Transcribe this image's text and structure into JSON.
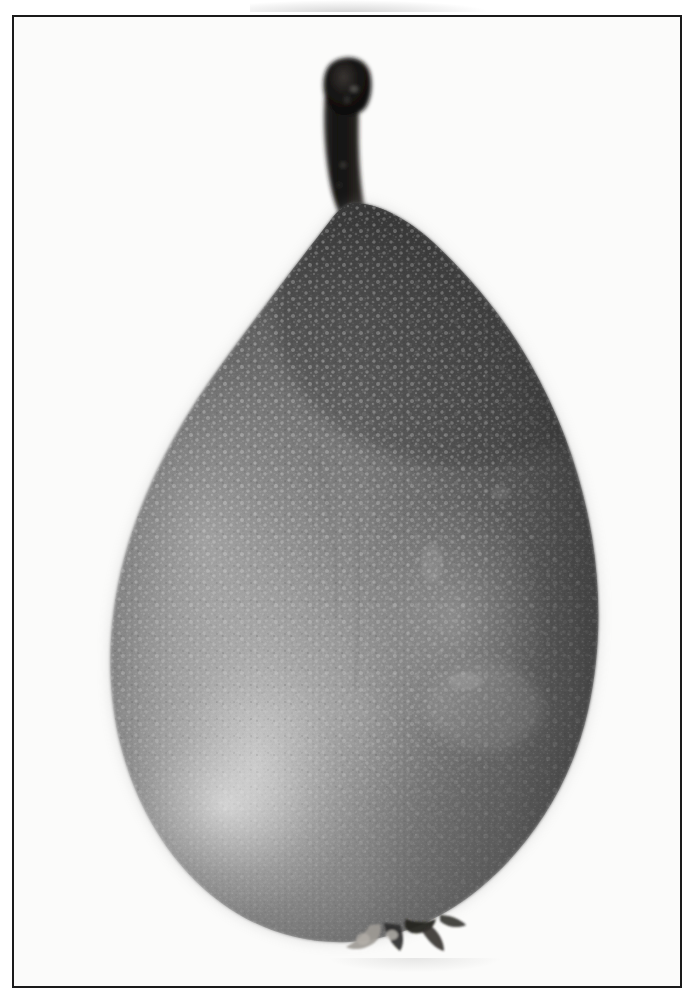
{
  "image": {
    "kind": "photographic-plate",
    "subject": "pear",
    "medium": "black-and-white photograph",
    "alt_text": "Black and white photograph of a single pear with a long dark stem, shown against a plain white background inside a thin black rectangular border.",
    "caption": "",
    "background_color": "#fbfbfa",
    "frame": {
      "color": "#1a1a1a",
      "thickness_px": 2,
      "left": 12,
      "top": 15,
      "width": 670,
      "height": 973
    }
  },
  "subject": {
    "name": "pear",
    "orientation": "upright, stem at top",
    "body": {
      "label": "pear-body",
      "left_px": 113,
      "right_px": 600,
      "top_px": 200,
      "bottom_px": 950,
      "widest_point_y_px": 790,
      "base_tone": "#6e6e6e",
      "shadow_tone": "#3c3c3c",
      "highlight_tone": "#d2d2d2"
    },
    "stem": {
      "label": "pear-stem",
      "top_px": 55,
      "bottom_px": 218,
      "left_px": 318,
      "right_px": 368,
      "tone": "#1d1b1a",
      "description": "thick dark stem with bulbous woody cap at the tip, tapering downward to the shoulder"
    },
    "calyx": {
      "label": "calyx-remnant",
      "center_x_px": 392,
      "center_y_px": 934,
      "tone": "#2b2b2b",
      "description": "dried sepals at the blossom end"
    },
    "skin": {
      "texture": "dense pale lenticel speckling (russeted skin)",
      "lenticel_tone": "#b9b9b9",
      "density": "heaviest on the left and centre, smoother toward the right shoulder"
    },
    "lighting": {
      "key_light_direction": "upper-left / front-left",
      "specular_highlight": {
        "center_x_px": 222,
        "center_y_px": 800,
        "tone": "#e0e0e0"
      },
      "terminator_side": "right",
      "darkest_region": "upper-right shoulder and right rim"
    }
  },
  "tones": {
    "paper_white": "#fbfbfa",
    "frame_black": "#1a1a1a",
    "pear_mid": "#707070",
    "pear_dark": "#393939",
    "pear_light": "#cfcfcf",
    "stem_black": "#1d1b1a"
  }
}
